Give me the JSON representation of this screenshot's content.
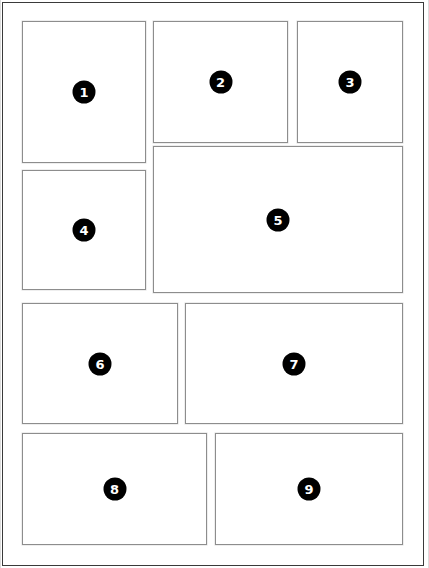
{
  "page": {
    "width": 429,
    "height": 568,
    "background_color": "#ffffff",
    "frame_color": "#3a3a3a",
    "box_border_color": "#8d8d8d",
    "badge_color": "#000000",
    "badge_text_color": "#ffffff"
  },
  "boxes": [
    {
      "id": "box-1",
      "label": "1",
      "x": 22,
      "y": 21,
      "width": 124,
      "height": 142
    },
    {
      "id": "box-2",
      "label": "2",
      "x": 153,
      "y": 21,
      "width": 135,
      "height": 122
    },
    {
      "id": "box-3",
      "label": "3",
      "x": 297,
      "y": 21,
      "width": 106,
      "height": 122
    },
    {
      "id": "box-4",
      "label": "4",
      "x": 22,
      "y": 170,
      "width": 124,
      "height": 120
    },
    {
      "id": "box-5",
      "label": "5",
      "x": 153,
      "y": 146,
      "width": 250,
      "height": 147
    },
    {
      "id": "box-6",
      "label": "6",
      "x": 22,
      "y": 303,
      "width": 156,
      "height": 121
    },
    {
      "id": "box-7",
      "label": "7",
      "x": 185,
      "y": 303,
      "width": 218,
      "height": 121
    },
    {
      "id": "box-8",
      "label": "8",
      "x": 22,
      "y": 433,
      "width": 185,
      "height": 112
    },
    {
      "id": "box-9",
      "label": "9",
      "x": 215,
      "y": 433,
      "width": 188,
      "height": 112
    }
  ]
}
